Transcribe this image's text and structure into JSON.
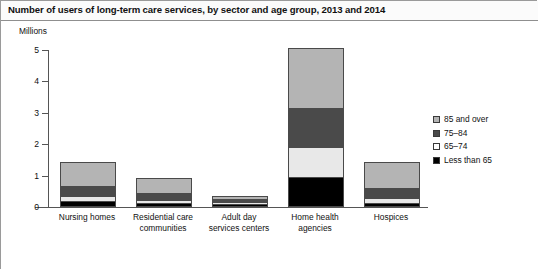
{
  "header": {
    "title": "Number of users of long-term care services, by sector and age group, 2013 and 2014"
  },
  "chart_data": {
    "type": "bar",
    "subtype": "stacked-vertical",
    "title": "Number of users of long-term care services, by sector and age group, 2013 and 2014",
    "xlabel": "",
    "ylabel": "Millions",
    "ylim": [
      0,
      5
    ],
    "yticks": [
      0,
      1,
      2,
      3,
      4,
      5
    ],
    "ytick_labels": [
      "0",
      "1",
      "2",
      "3",
      "4",
      "5"
    ],
    "grid": false,
    "legend_position": "right",
    "categories": [
      "Nursing homes",
      "Residential care communities",
      "Adult day services centers",
      "Home health agencies",
      "Hospices"
    ],
    "category_lines": [
      [
        "Nursing homes"
      ],
      [
        "Residential care",
        "communities"
      ],
      [
        "Adult day",
        "services centers"
      ],
      [
        "Home health",
        "agencies"
      ],
      [
        "Hospices"
      ]
    ],
    "series": [
      {
        "name": "Less than 65",
        "color": "#000000",
        "values": [
          0.17,
          0.1,
          0.06,
          0.92,
          0.09
        ]
      },
      {
        "name": "65-74",
        "color": "#e8e8e8",
        "values": [
          0.15,
          0.1,
          0.08,
          0.96,
          0.15
        ]
      },
      {
        "name": "75-84",
        "color": "#4a4a4a",
        "values": [
          0.32,
          0.22,
          0.07,
          1.25,
          0.32
        ]
      },
      {
        "name": "85 and over",
        "color": "#b4b4b4",
        "values": [
          0.73,
          0.43,
          0.07,
          1.87,
          0.81
        ]
      }
    ],
    "totals": [
      1.37,
      0.85,
      0.28,
      5.0,
      1.37
    ]
  },
  "legend": {
    "items": [
      {
        "label": "85 and over",
        "color": "#b4b4b4"
      },
      {
        "label": "75–84",
        "color": "#4a4a4a"
      },
      {
        "label": "65–74",
        "color": "#ffffff"
      },
      {
        "label": "Less than 65",
        "color": "#000000"
      }
    ]
  },
  "axis": {
    "unit_label": "Millions"
  }
}
